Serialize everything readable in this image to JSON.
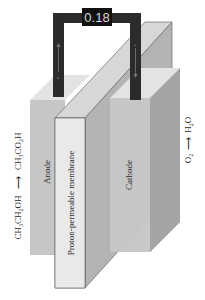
{
  "figure": {
    "meter": {
      "reading": "0.18"
    },
    "components": {
      "anode_label": "Anode",
      "membrane_label": "Proton-permeable membrane",
      "cathode_label": "Cathode"
    },
    "reactions": {
      "anode": {
        "reactant": "CH3CH2OH",
        "product": "CH3CO2H",
        "arrow": "→"
      },
      "cathode": {
        "reactant": "O2",
        "product": "H2O",
        "arrow": "→"
      }
    },
    "electron_labels": {
      "left": "e",
      "right": "e"
    },
    "colors": {
      "wire": "#2b2b2b",
      "meter_bg": "#111111",
      "meter_text": "#dddddd",
      "block_front": "#c9c9c9",
      "block_top": "#e2e2e2",
      "block_side": "#a9a9a9",
      "membrane_front": "#e8e8e8"
    }
  }
}
